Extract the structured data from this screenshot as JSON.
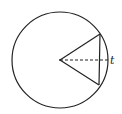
{
  "diagram": {
    "type": "circle-geometry",
    "circle": {
      "cx": 60,
      "cy": 60,
      "r": 48
    },
    "center": {
      "x": 60,
      "y": 60
    },
    "chord": {
      "x1": 100,
      "y1": 34,
      "x2": 99,
      "y2": 85
    },
    "radii": [
      {
        "x1": 60,
        "y1": 60,
        "x2": 100,
        "y2": 34
      },
      {
        "x1": 60,
        "y1": 60,
        "x2": 99,
        "y2": 85
      }
    ],
    "dashed_segment": {
      "x1": 60,
      "y1": 60,
      "x2": 108,
      "y2": 60
    },
    "label": {
      "text": "t",
      "x": 110,
      "y": 64
    },
    "stroke_color": "#222222"
  }
}
